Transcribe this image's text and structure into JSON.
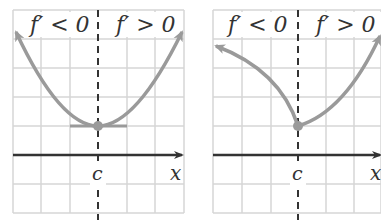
{
  "panels": [
    {
      "id": "left",
      "label_left": "f′ < 0",
      "label_right": "f′ > 0",
      "critical_label": "c",
      "axis_label": "x",
      "curve": "smooth parabola with horizontal tangent at c (f'(c)=0)"
    },
    {
      "id": "right",
      "label_left": "f′ < 0",
      "label_right": "f′ > 0",
      "critical_label": "c",
      "axis_label": "x",
      "curve": "cusp/corner at c (f'(c) undefined)"
    }
  ],
  "colors": {
    "curve": "#9a9a9a",
    "grid": "#d6d6d6",
    "axis": "#333333",
    "dash": "#333333"
  }
}
